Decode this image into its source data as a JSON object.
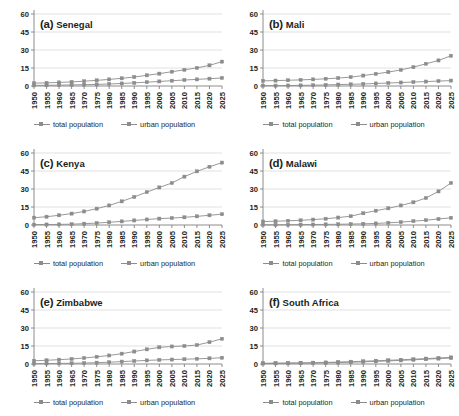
{
  "figure": {
    "panel_count": 6,
    "x_tick_labels": [
      "1950",
      "1955",
      "1960",
      "1965",
      "1970",
      "1975",
      "1980",
      "1985",
      "1990",
      "1995",
      "2000",
      "2005",
      "2010",
      "2015",
      "2020",
      "2025"
    ],
    "y_tick_labels": [
      "0",
      "15",
      "30",
      "45",
      "60"
    ],
    "legend": [
      {
        "key": "total",
        "label": "total population"
      },
      {
        "key": "urban",
        "label": "urban population"
      }
    ],
    "colors": {
      "line": "#8c8c8c",
      "marker": "#8c8c8c",
      "grid": "#d9d9d9",
      "axis": "#808080",
      "text": "#231f20",
      "background": "#ffffff"
    }
  },
  "chart_data": [
    {
      "type": "line",
      "panel": "a",
      "title": "(a) Senegal",
      "panel_label": "(a)",
      "country": "Senegal",
      "xlabel": "",
      "ylabel": "",
      "ylim": [
        0,
        60
      ],
      "yticks": [
        0,
        15,
        30,
        45,
        60
      ],
      "grid": true,
      "legend_position": "bottom",
      "x": [
        1950,
        1955,
        1960,
        1965,
        1970,
        1975,
        1980,
        1985,
        1990,
        1995,
        2000,
        2005,
        2010,
        2015,
        2020,
        2025
      ],
      "series": [
        {
          "name": "total population",
          "values": [
            2.4,
            2.6,
            3.0,
            3.4,
            4.0,
            4.7,
            5.5,
            6.4,
            7.5,
            8.9,
            10.3,
            11.9,
            13.5,
            15.1,
            17.2,
            20.3
          ]
        },
        {
          "name": "urban population",
          "values": [
            0.5,
            0.6,
            0.7,
            0.9,
            1.1,
            1.3,
            1.7,
            2.1,
            2.6,
            3.2,
            3.8,
            4.4,
            5.0,
            5.5,
            6.1,
            6.7
          ]
        }
      ]
    },
    {
      "type": "line",
      "panel": "b",
      "title": "(b) Mali",
      "panel_label": "(b)",
      "country": "Mali",
      "xlabel": "",
      "ylabel": "",
      "ylim": [
        0,
        60
      ],
      "yticks": [
        0,
        15,
        30,
        45,
        60
      ],
      "grid": true,
      "legend_position": "bottom",
      "x": [
        1950,
        1955,
        1960,
        1965,
        1970,
        1975,
        1980,
        1985,
        1990,
        1995,
        2000,
        2005,
        2010,
        2015,
        2020,
        2025
      ],
      "series": [
        {
          "name": "total population",
          "values": [
            4.3,
            4.5,
            4.8,
            5.1,
            5.5,
            6.0,
            6.6,
            7.4,
            8.7,
            10.1,
            11.6,
            13.4,
            15.7,
            18.5,
            21.3,
            25.2
          ]
        },
        {
          "name": "urban population",
          "values": [
            0.3,
            0.3,
            0.4,
            0.5,
            0.7,
            0.9,
            1.2,
            1.4,
            1.7,
            2.1,
            2.5,
            2.9,
            3.3,
            3.7,
            4.1,
            4.5
          ]
        }
      ]
    },
    {
      "type": "line",
      "panel": "c",
      "title": "(c) Kenya",
      "panel_label": "(c)",
      "country": "Kenya",
      "xlabel": "",
      "ylabel": "",
      "ylim": [
        0,
        60
      ],
      "yticks": [
        0,
        15,
        30,
        45,
        60
      ],
      "grid": true,
      "legend_position": "bottom",
      "x": [
        1950,
        1955,
        1960,
        1965,
        1970,
        1975,
        1980,
        1985,
        1990,
        1995,
        2000,
        2005,
        2010,
        2015,
        2020,
        2025
      ],
      "series": [
        {
          "name": "total population",
          "values": [
            6.1,
            6.9,
            8.1,
            9.5,
            11.3,
            13.6,
            16.3,
            19.7,
            23.4,
            27.4,
            31.3,
            35.0,
            40.3,
            44.7,
            48.5,
            52.0
          ]
        },
        {
          "name": "urban population",
          "values": [
            0.3,
            0.4,
            0.5,
            0.7,
            1.1,
            1.6,
            2.3,
            3.0,
            3.8,
            4.6,
            5.3,
            5.8,
            6.4,
            7.2,
            8.1,
            9.0
          ]
        }
      ]
    },
    {
      "type": "line",
      "panel": "d",
      "title": "(d) Malawi",
      "panel_label": "(d)",
      "country": "Malawi",
      "xlabel": "",
      "ylabel": "",
      "ylim": [
        0,
        60
      ],
      "yticks": [
        0,
        15,
        30,
        45,
        60
      ],
      "grid": true,
      "legend_position": "bottom",
      "x": [
        1950,
        1955,
        1960,
        1965,
        1970,
        1975,
        1980,
        1985,
        1990,
        1995,
        2000,
        2005,
        2010,
        2015,
        2020,
        2025
      ],
      "series": [
        {
          "name": "total population",
          "values": [
            2.9,
            3.1,
            3.5,
            3.9,
            4.5,
            5.2,
            6.2,
            7.3,
            9.8,
            11.9,
            13.9,
            16.3,
            18.9,
            22.5,
            28.0,
            35.0
          ]
        },
        {
          "name": "urban population",
          "values": [
            0.2,
            0.2,
            0.2,
            0.3,
            0.4,
            0.5,
            0.6,
            0.8,
            1.0,
            1.3,
            1.8,
            2.4,
            3.2,
            4.0,
            5.0,
            6.0
          ]
        }
      ]
    },
    {
      "type": "line",
      "panel": "e",
      "title": "(e) Zimbabwe",
      "panel_label": "(e)",
      "country": "Zimbabwe",
      "xlabel": "",
      "ylabel": "",
      "ylim": [
        0,
        60
      ],
      "yticks": [
        0,
        15,
        30,
        45,
        60
      ],
      "grid": true,
      "legend_position": "bottom",
      "x": [
        1950,
        1955,
        1960,
        1965,
        1970,
        1975,
        1980,
        1985,
        1990,
        1995,
        2000,
        2005,
        2010,
        2015,
        2020,
        2025
      ],
      "series": [
        {
          "name": "total population",
          "values": [
            2.7,
            3.1,
            3.6,
            4.2,
            5.0,
            6.0,
            7.1,
            8.6,
            10.4,
            12.2,
            13.9,
            14.6,
            15.0,
            15.8,
            18.2,
            21.0
          ]
        },
        {
          "name": "urban population",
          "values": [
            0.3,
            0.4,
            0.5,
            0.6,
            0.8,
            1.1,
            1.5,
            2.0,
            2.5,
            3.0,
            3.4,
            3.7,
            4.0,
            4.3,
            4.7,
            5.2
          ]
        }
      ]
    },
    {
      "type": "line",
      "panel": "f",
      "title": "(f) South Africa",
      "panel_label": "(f)",
      "country": "South Africa",
      "xlabel": "",
      "ylabel": "",
      "ylim": [
        0,
        60
      ],
      "yticks": [
        0,
        15,
        30,
        45,
        60
      ],
      "grid": true,
      "legend_position": "bottom",
      "x": [
        1950,
        1955,
        1960,
        1965,
        1970,
        1975,
        1980,
        1985,
        1990,
        1995,
        2000,
        2005,
        2010,
        2015,
        2020,
        2025
      ],
      "series": [
        {
          "name": "total population",
          "values": [
            0.6,
            0.7,
            0.8,
            0.9,
            1.1,
            1.3,
            1.6,
            1.9,
            2.3,
            2.7,
            3.1,
            3.5,
            4.0,
            4.5,
            5.0,
            5.5
          ]
        },
        {
          "name": "urban population",
          "values": [
            0.4,
            0.5,
            0.6,
            0.7,
            0.8,
            1.0,
            1.2,
            1.5,
            1.8,
            2.2,
            2.6,
            3.0,
            3.5,
            4.0,
            4.5,
            5.0
          ]
        }
      ]
    }
  ]
}
